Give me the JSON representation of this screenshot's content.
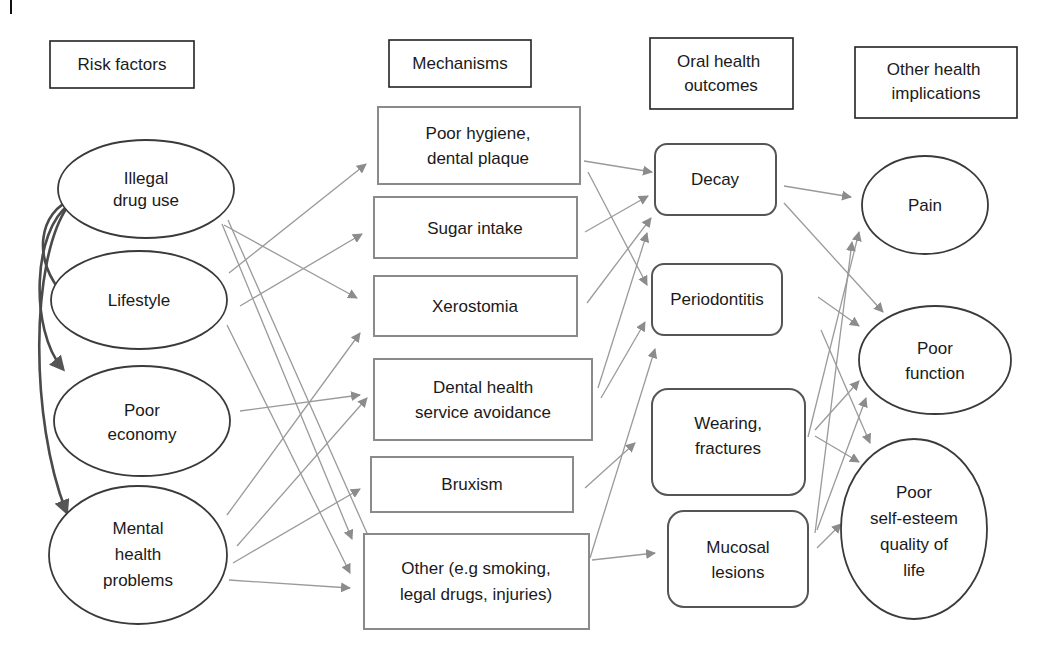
{
  "columns": {
    "risk_factors": {
      "header": [
        "Risk factors"
      ]
    },
    "mechanisms": {
      "header": [
        "Mechanisms"
      ]
    },
    "oral_outcomes": {
      "header": [
        "Oral health",
        "outcomes"
      ]
    },
    "other_implications": {
      "header": [
        "Other health",
        "implications"
      ]
    }
  },
  "risk_factors": [
    {
      "id": "illegal",
      "lines": [
        "Illegal",
        "drug use"
      ]
    },
    {
      "id": "lifestyle",
      "lines": [
        "Lifestyle"
      ]
    },
    {
      "id": "economy",
      "lines": [
        "Poor",
        "economy"
      ]
    },
    {
      "id": "mental",
      "lines": [
        "Mental",
        "health",
        "problems"
      ]
    }
  ],
  "mechanisms": [
    {
      "id": "hygiene",
      "lines": [
        "Poor hygiene,",
        "dental plaque"
      ]
    },
    {
      "id": "sugar",
      "lines": [
        "Sugar intake"
      ]
    },
    {
      "id": "xero",
      "lines": [
        "Xerostomia"
      ]
    },
    {
      "id": "avoid",
      "lines": [
        "Dental health",
        "service avoidance"
      ]
    },
    {
      "id": "brux",
      "lines": [
        "Bruxism"
      ]
    },
    {
      "id": "other",
      "lines": [
        "Other (e.g smoking,",
        "legal drugs, injuries)"
      ]
    }
  ],
  "oral_outcomes": [
    {
      "id": "decay",
      "lines": [
        "Decay"
      ]
    },
    {
      "id": "perio",
      "lines": [
        "Periodontitis"
      ]
    },
    {
      "id": "wear",
      "lines": [
        "Wearing,",
        "fractures"
      ]
    },
    {
      "id": "mucosal",
      "lines": [
        "Mucosal",
        "lesions"
      ]
    }
  ],
  "other_implications": [
    {
      "id": "pain",
      "lines": [
        "Pain"
      ]
    },
    {
      "id": "function",
      "lines": [
        "Poor",
        "function"
      ]
    },
    {
      "id": "esteem",
      "lines": [
        "Poor",
        "self-esteem",
        "quality of",
        "life"
      ]
    }
  ],
  "colors": {
    "edge": "#9a9a9a",
    "thick_arrow": "#4a4a4a",
    "text": "#1a1a1a"
  }
}
